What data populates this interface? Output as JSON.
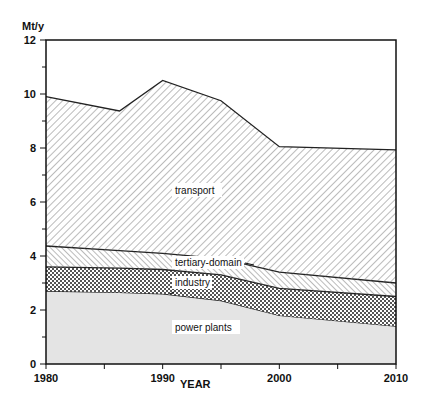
{
  "chart_data": {
    "type": "area",
    "stacked": true,
    "title": "",
    "xlabel": "YEAR",
    "ylabel": "Mt/y",
    "xlim": [
      1980,
      2010
    ],
    "ylim": [
      0,
      12
    ],
    "x_ticks": [
      1980,
      1990,
      2000,
      2010
    ],
    "y_ticks": [
      0,
      2,
      4,
      6,
      8,
      10,
      12
    ],
    "grid": false,
    "legend": "inline labels",
    "x": [
      1980,
      1986.3,
      1990,
      1995,
      2000,
      2010
    ],
    "cumulative_tops": {
      "power plants": [
        2.7,
        2.65,
        2.6,
        2.35,
        1.8,
        1.4
      ],
      "industry": [
        3.6,
        3.55,
        3.5,
        3.3,
        2.8,
        2.5
      ],
      "tertiary-domain": [
        4.37,
        4.2,
        4.1,
        3.9,
        3.4,
        3.0
      ],
      "transport": [
        9.9,
        9.37,
        10.5,
        9.75,
        8.05,
        7.93
      ]
    },
    "series": [
      {
        "name": "power plants",
        "values": [
          2.7,
          2.65,
          2.6,
          2.35,
          1.8,
          1.4
        ],
        "pattern": "grey-fill"
      },
      {
        "name": "industry",
        "values": [
          0.9,
          0.9,
          0.9,
          0.95,
          1.0,
          1.1
        ],
        "pattern": "cross-hatch"
      },
      {
        "name": "tertiary-domain",
        "values": [
          0.77,
          0.65,
          0.6,
          0.6,
          0.6,
          0.5
        ],
        "pattern": "dense-diagonal"
      },
      {
        "name": "transport",
        "values": [
          5.53,
          5.17,
          6.4,
          5.85,
          4.65,
          4.93
        ],
        "pattern": "diagonal"
      }
    ]
  },
  "labels": {
    "ylabel": "Mt/y",
    "xlabel": "YEAR",
    "transport": "transport",
    "tertiary": "tertiary-domain",
    "industry": "industry",
    "power": "power plants",
    "yticks": [
      "0",
      "2",
      "4",
      "6",
      "8",
      "10",
      "12"
    ],
    "xticks": [
      "1980",
      "1990",
      "2000",
      "2010"
    ]
  }
}
